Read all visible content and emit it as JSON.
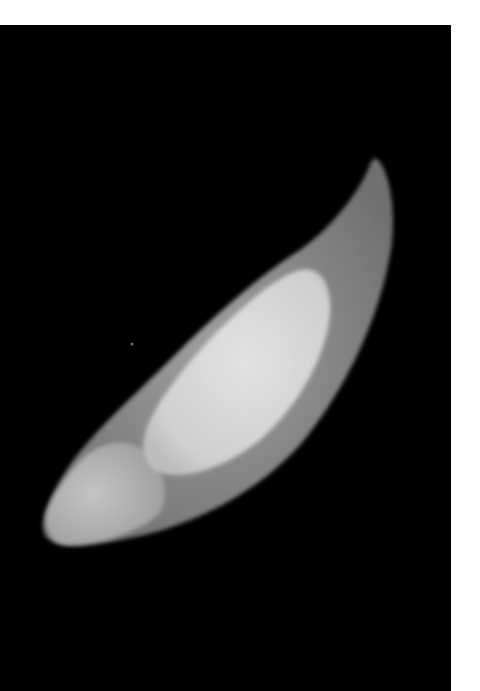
{
  "image": {
    "subject": "seed-micrograph",
    "description": "Elongated pale seed with a curved pointed tip on a black background; an inner bright oval body is visible inside a translucent grey coat.",
    "colors": {
      "background": "#000000",
      "page": "#ffffff",
      "coat": "#8c8c8c",
      "inner_body": "#d6d6d6",
      "base_region": "#b4b4b4"
    }
  }
}
